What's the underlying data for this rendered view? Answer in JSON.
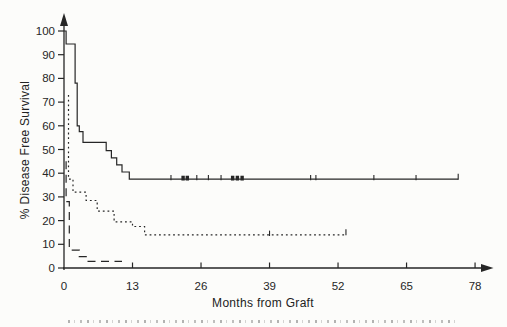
{
  "figure": {
    "kind": "scanned journal Kaplan-Meier survival plot",
    "xlabel": "Months from Graft",
    "ylabel": "% Disease Free Survival"
  },
  "chart_data": {
    "type": "line",
    "subtype": "kaplan-meier-step",
    "title": "",
    "xlabel": "Months from Graft",
    "ylabel": "% Disease Free Survival",
    "xlim": [
      0,
      82
    ],
    "ylim": [
      0,
      104
    ],
    "xticks": [
      0,
      13,
      26,
      39,
      52,
      65,
      78
    ],
    "yticks": [
      0,
      10,
      20,
      30,
      40,
      50,
      60,
      70,
      80,
      90,
      100
    ],
    "grid": false,
    "legend_position": "none",
    "axis_arrows": true,
    "colors": {
      "line": "#262626",
      "text": "#262626",
      "paper": "#fcfcfa"
    },
    "series": [
      {
        "name": "solid",
        "style": "solid",
        "final_plateau_pct": 37.5,
        "points": [
          [
            0,
            100
          ],
          [
            0.4,
            100
          ],
          [
            0.4,
            94.5
          ],
          [
            2.1,
            94.5
          ],
          [
            2.1,
            78
          ],
          [
            2.5,
            78
          ],
          [
            2.5,
            60
          ],
          [
            2.9,
            60
          ],
          [
            2.9,
            57.5
          ],
          [
            3.6,
            57.5
          ],
          [
            3.6,
            53
          ],
          [
            8,
            53
          ],
          [
            8,
            49.5
          ],
          [
            9,
            49.5
          ],
          [
            9,
            46.5
          ],
          [
            10,
            46.5
          ],
          [
            10,
            43.5
          ],
          [
            11,
            43.5
          ],
          [
            11,
            40.5
          ],
          [
            12.4,
            40.5
          ],
          [
            12.4,
            37.5
          ],
          [
            74.8,
            37.5
          ]
        ],
        "censor_ticks": [
          20.3,
          25.2,
          27.4,
          29.8,
          46.8,
          47.8,
          58.8,
          66.8
        ],
        "censor_bold": [
          22.6,
          23.4,
          32,
          32.9,
          33.8
        ],
        "terminal_tick": 74.8
      },
      {
        "name": "dotted",
        "style": "dotted",
        "final_plateau_pct": 14,
        "points": [
          [
            0.85,
            73
          ],
          [
            0.85,
            37.5
          ],
          [
            1.7,
            37.5
          ],
          [
            1.7,
            32
          ],
          [
            4.2,
            32
          ],
          [
            4.2,
            28.5
          ],
          [
            6.3,
            28.5
          ],
          [
            6.3,
            24
          ],
          [
            9.5,
            24
          ],
          [
            9.5,
            19.5
          ],
          [
            13,
            19.5
          ],
          [
            13,
            17.5
          ],
          [
            15.3,
            17.5
          ],
          [
            15.3,
            14
          ],
          [
            53.5,
            14
          ]
        ],
        "censor_ticks": [
          39
        ],
        "censor_bold": [],
        "terminal_tick": 53.5
      },
      {
        "name": "dashed",
        "style": "dashed",
        "final_plateau_pct": 3,
        "points": [
          [
            0.4,
            45
          ],
          [
            0.4,
            28
          ],
          [
            1,
            28
          ],
          [
            1,
            7.5
          ],
          [
            2.9,
            7.5
          ],
          [
            2.9,
            4.8
          ],
          [
            4.4,
            4.8
          ],
          [
            4.4,
            2.8
          ],
          [
            11,
            2.8
          ]
        ],
        "censor_ticks": [],
        "censor_bold": [],
        "terminal_tick": null
      }
    ]
  }
}
